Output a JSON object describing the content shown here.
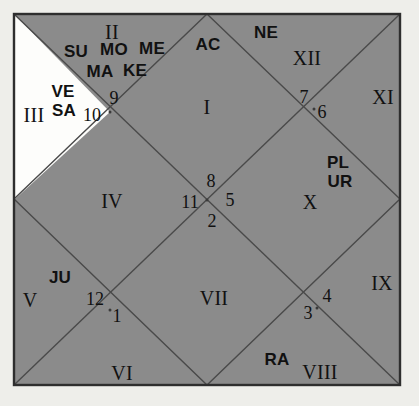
{
  "chart": {
    "type": "vedic-north-indian-diamond-chart",
    "title": "",
    "colors": {
      "page_background": "#eeeeea",
      "chart_fill": "#8b8b8b",
      "empty_house_fill": "#fdfdfb",
      "line": "#4a4a4a",
      "border": "#2e2e2e",
      "text": "#111111"
    },
    "geometry": {
      "square": {
        "x1": 14,
        "y1": 14,
        "x2": 400,
        "y2": 385
      },
      "note": "Outer square with both full diagonals plus the inscribed diamond connecting edge midpoints, forming 12 houses."
    },
    "houses": [
      {
        "roman": "I",
        "sign_number": "",
        "planets": [
          "AC"
        ],
        "empty": false
      },
      {
        "roman": "II",
        "sign_number": "9",
        "planets": [
          "SU",
          "MO",
          "ME",
          "MA",
          "KE"
        ],
        "empty": false
      },
      {
        "roman": "III",
        "sign_number": "10",
        "planets": [
          "VE",
          "SA"
        ],
        "empty": true
      },
      {
        "roman": "IV",
        "sign_number": "11",
        "planets": [],
        "empty": false
      },
      {
        "roman": "V",
        "sign_number": "12",
        "planets": [
          "JU"
        ],
        "empty": false
      },
      {
        "roman": "VI",
        "sign_number": "1",
        "planets": [],
        "empty": false
      },
      {
        "roman": "VII",
        "sign_number": "2",
        "planets": [],
        "empty": false
      },
      {
        "roman": "VIII",
        "sign_number": "3",
        "planets": [
          "RA"
        ],
        "empty": false
      },
      {
        "roman": "IX",
        "sign_number": "4",
        "planets": [],
        "empty": false
      },
      {
        "roman": "X",
        "sign_number": "5",
        "planets": [
          "PL",
          "UR"
        ],
        "empty": false
      },
      {
        "roman": "XI",
        "sign_number": "6",
        "planets": [],
        "empty": false
      },
      {
        "roman": "XII",
        "sign_number": "7",
        "planets": [
          "NE"
        ],
        "empty": false
      }
    ],
    "house_romans": {
      "h1": "I",
      "h2": "II",
      "h3": "III",
      "h4": "IV",
      "h5": "V",
      "h6": "VI",
      "h7": "VII",
      "h8": "VIII",
      "h9": "IX",
      "h10": "X",
      "h11": "XI",
      "h12": "XII"
    },
    "sign_numbers": {
      "n1": "1",
      "n2": "2",
      "n3": "3",
      "n4": "4",
      "n5": "5",
      "n6": "6",
      "n7": "7",
      "n8": "8",
      "n9": "9",
      "n10": "10",
      "n11": "11",
      "n12": "12"
    },
    "planet_glyphs": {
      "ascendant": "AC",
      "sun": "SU",
      "moon": "MO",
      "mercury": "ME",
      "mars": "MA",
      "ketu": "KE",
      "venus": "VE",
      "saturn": "SA",
      "jupiter": "JU",
      "rahu": "RA",
      "pluto": "PL",
      "uranus": "UR",
      "neptune": "NE"
    }
  }
}
